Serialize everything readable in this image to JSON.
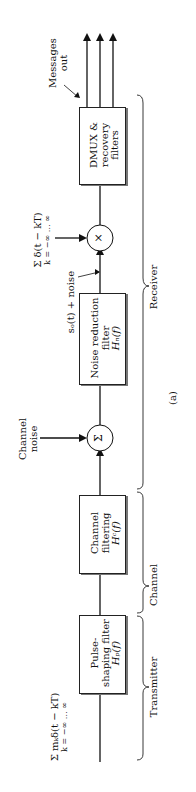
{
  "diagram": {
    "caption": "(a)",
    "blocks": {
      "pulse": {
        "line1": "Pulse-",
        "line2": "shaping filter",
        "line3": "Hₚ(f)"
      },
      "channel": {
        "line1": "Channel",
        "line2": "filtering",
        "line3": "Hᶜ(f)"
      },
      "noise": {
        "line1": "Noise reduction",
        "line2": "filter",
        "line3": "Hₙ(f)"
      },
      "dmux": {
        "line1": "DMUX &",
        "line2": "recovery",
        "line3": "filters"
      }
    },
    "nodes": {
      "sum": "Σ",
      "mult": "×"
    },
    "labels": {
      "input": "Σ mₖδ(t − kT)",
      "input_limits": "k = −∞  …  ∞",
      "channel_noise_1": "Channel",
      "channel_noise_2": "noise",
      "so_noise": "sₒ(t) + noise",
      "sampling": "Σ δ(t − kT)",
      "sampling_limits": "k = −∞  …  ∞",
      "messages_1": "Messages",
      "messages_2": "out"
    },
    "sections": {
      "transmitter": "Transmitter",
      "channel": "Channel",
      "receiver": "Receiver"
    }
  }
}
